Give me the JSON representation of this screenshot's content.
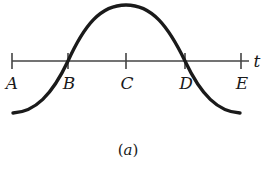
{
  "figure": {
    "caption_open": "(",
    "caption_letter": "a",
    "caption_close": ")",
    "axis_label": "t",
    "points": [
      {
        "label": "A",
        "x": 12
      },
      {
        "label": "B",
        "x": 68
      },
      {
        "label": "C",
        "x": 126
      },
      {
        "label": "D",
        "x": 185
      },
      {
        "label": "E",
        "x": 241
      }
    ],
    "curve": {
      "shape": "cosine-like wave",
      "description": "Curve starts below the axis at A, crosses the axis upward at B, reaches its maximum at C, crosses downward at D, and ends below the axis at E"
    },
    "colors": {
      "line": "#1a1a1a",
      "axis": "#444444",
      "background": "#ffffff"
    }
  }
}
